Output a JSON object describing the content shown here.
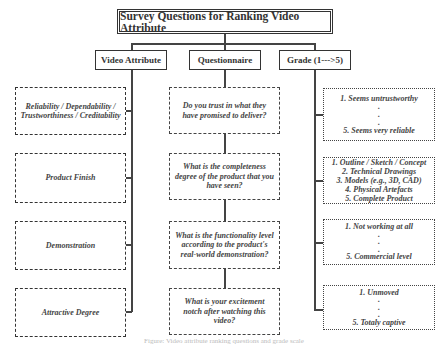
{
  "title": "Survey Questions for Ranking Video Attribute",
  "columns": {
    "attribute": {
      "header": "Video Attribute",
      "items": [
        "Reliability / Dependability / Trustworthiness / Creditability",
        "Product Finish",
        "Demonstration",
        "Attractive Degree"
      ]
    },
    "questionnaire": {
      "header": "Questionnaire",
      "items": [
        "Do you trust in what they have promised to deliver?",
        "What is the completeness degree of the product that you have seen?",
        "What is the functionality level according to the product's real-world demonstration?",
        "What is your excitement notch after watching this video?"
      ]
    },
    "grade": {
      "header": "Grade (1--->5)",
      "items": [
        {
          "lines": [
            "1. Seems untrustworthy",
            ".",
            ".",
            ".",
            "5. Seems very reliable"
          ]
        },
        {
          "lines": [
            "1. Outline / Sketch / Concept",
            "2. Technical Drawings",
            "3. Models (e.g., 3D, CAD)",
            "4. Physical Artefacts",
            "5. Complete Product"
          ]
        },
        {
          "lines": [
            "1. Not working at all",
            ".",
            ".",
            ".",
            "5. Commercial level"
          ]
        },
        {
          "lines": [
            "1. Unmoved",
            ".",
            ".",
            ".",
            "5. Totaly captive"
          ]
        }
      ]
    }
  },
  "caption": "Figure: Video attribute ranking questions and grade scale"
}
